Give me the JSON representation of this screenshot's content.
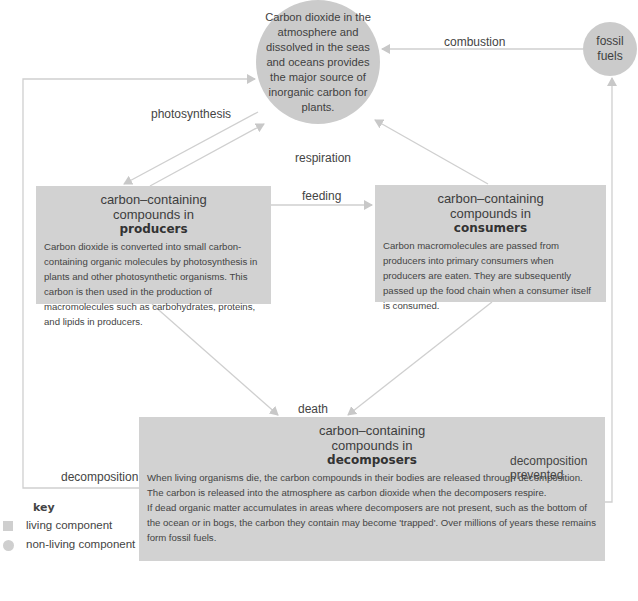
{
  "diagram": {
    "colors": {
      "living_fill": "#d2d2d2",
      "nonliving_fill": "#cbcbcb",
      "arrow_color": "#c8c8c8",
      "text_color": "#444444"
    },
    "nodes": {
      "atmosphere": {
        "shape": "circle",
        "text": "Carbon dioxide in the atmosphere and dissolved in the seas and oceans provides the major source of inorganic carbon for plants."
      },
      "fossil_fuels": {
        "shape": "circle",
        "text": "fossil fuels"
      },
      "producers": {
        "shape": "box",
        "heading1": "carbon–containing",
        "heading2": "compounds in",
        "heading3": "producers",
        "description": "Carbon dioxide is converted into small carbon-containing organic molecules by photosynthesis in plants and other photosynthetic organisms. This carbon is then used in the production of macromolecules such as carbohydrates, proteins, and lipids in producers."
      },
      "consumers": {
        "shape": "box",
        "heading1": "carbon–containing",
        "heading2": "compounds in",
        "heading3": "consumers",
        "description": "Carbon macromolecules are passed from producers into primary consumers when producers are eaten. They are subsequently passed up the food chain when a consumer itself is consumed."
      },
      "decomposers": {
        "shape": "box",
        "heading1": "carbon–containing",
        "heading2": "compounds in",
        "heading3": "decomposers",
        "description1": "When living organisms die, the carbon compounds in their bodies are released through decomposition. The carbon is released into the atmosphere as carbon dioxide when the decomposers respire.",
        "description2": "If dead organic matter accumulates in areas where decomposers are not present, such as the bottom of the ocean or in bogs, the carbon they contain may become 'trapped'. Over millions of years these remains form fossil fuels."
      }
    },
    "edge_labels": {
      "combustion": "combustion",
      "photosynthesis": "photosynthesis",
      "respiration": "respiration",
      "feeding": "feeding",
      "death": "death",
      "decomposition": "decomposition",
      "decomposition_prevented_1": "decomposition",
      "decomposition_prevented_2": "prevented"
    },
    "key": {
      "title": "key",
      "living": "living component",
      "nonliving": "non-living component"
    }
  }
}
